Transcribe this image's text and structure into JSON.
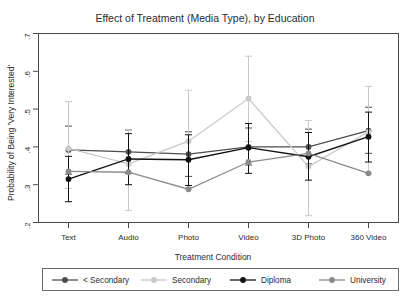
{
  "chart": {
    "title": "Effect of Treatment (Media Type), by Education",
    "xlabel": "Treatment Condition",
    "ylabel": "Probability of Being 'Very Interested'"
  },
  "legend": {
    "items": [
      {
        "label": "< Secondary",
        "color": "#4d4d4d"
      },
      {
        "label": "Secondary",
        "color": "#c9c9c9"
      },
      {
        "label": "Diploma",
        "color": "#111111"
      },
      {
        "label": "University",
        "color": "#8a8a8a"
      }
    ]
  },
  "axis": {
    "yticks": [
      ".7",
      ".6",
      ".5",
      ".4",
      ".3",
      ".2"
    ],
    "xticks": [
      "Text",
      "Audio",
      "Photo",
      "Video",
      "3D Photo",
      "360 Video"
    ]
  },
  "chart_data": {
    "type": "line",
    "title": "Effect of Treatment (Media Type), by Education",
    "xlabel": "Treatment Condition",
    "ylabel": "Probability of Being 'Very Interested'",
    "categories": [
      "Text",
      "Audio",
      "Photo",
      "Video",
      "3D Photo",
      "360 Video"
    ],
    "ylim": [
      0.2,
      0.7
    ],
    "ytick_values": [
      0.2,
      0.3,
      0.4,
      0.5,
      0.6,
      0.7
    ],
    "grid": false,
    "legend_position": "bottom",
    "error_bars": "95% confidence interval",
    "series": [
      {
        "name": "< Secondary",
        "color": "#4d4d4d",
        "values": [
          0.392,
          0.387,
          0.381,
          0.4,
          0.4,
          0.443
        ],
        "ci_low": [
          0.328,
          0.33,
          0.322,
          0.352,
          0.355,
          0.383
        ],
        "ci_high": [
          0.455,
          0.445,
          0.44,
          0.45,
          0.447,
          0.505
        ]
      },
      {
        "name": "Secondary",
        "color": "#c9c9c9",
        "values": [
          0.396,
          0.355,
          0.415,
          0.528,
          0.348,
          0.44
        ],
        "ci_low": [
          0.29,
          0.232,
          0.29,
          0.414,
          0.218,
          0.33
        ],
        "ci_high": [
          0.52,
          0.445,
          0.55,
          0.64,
          0.47,
          0.56
        ]
      },
      {
        "name": "Diploma",
        "color": "#111111",
        "values": [
          0.315,
          0.368,
          0.366,
          0.398,
          0.374,
          0.427
        ],
        "ci_low": [
          0.255,
          0.3,
          0.298,
          0.33,
          0.312,
          0.36
        ],
        "ci_high": [
          0.375,
          0.435,
          0.432,
          0.462,
          0.438,
          0.492
        ]
      },
      {
        "name": "University",
        "color": "#8a8a8a",
        "values": [
          0.335,
          0.333,
          0.288,
          0.36,
          0.383,
          0.33
        ],
        "ci_low": [
          0.27,
          0.268,
          0.225,
          0.295,
          0.318,
          0.268
        ]
      }
    ]
  }
}
